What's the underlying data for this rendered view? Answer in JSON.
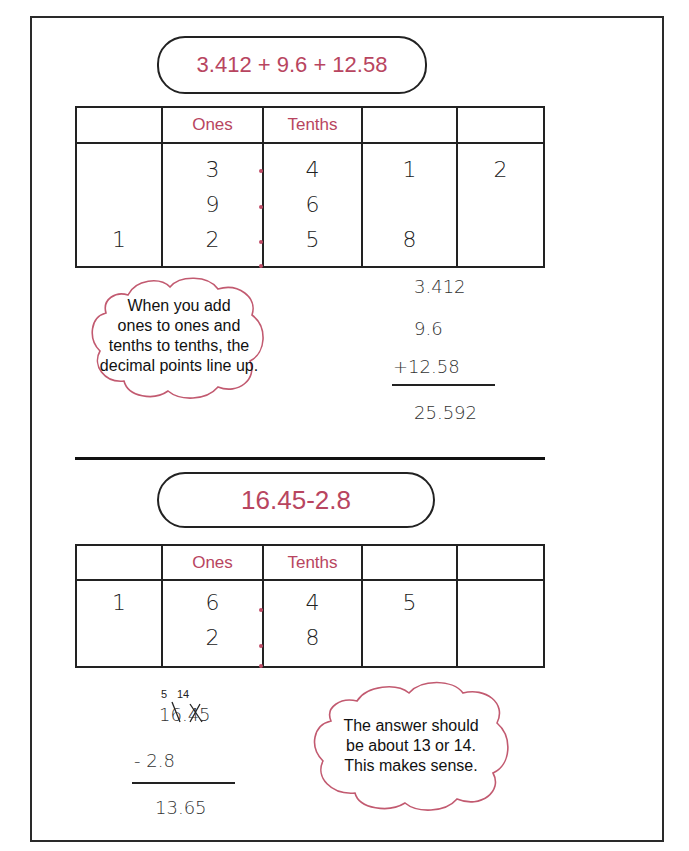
{
  "problem1": {
    "expression": "3.412 + 9.6 + 12.58",
    "table": {
      "headers": [
        "",
        "Ones",
        "Tenths",
        "",
        ""
      ],
      "columns": [
        [
          "",
          "",
          "1"
        ],
        [
          "3",
          "9",
          "2"
        ],
        [
          "4",
          "6",
          "5"
        ],
        [
          "1",
          "",
          "8"
        ],
        [
          "2",
          "",
          ""
        ]
      ]
    },
    "note": [
      "When you add",
      "ones to ones and",
      "tenths to tenths, the",
      "decimal points line up."
    ],
    "work": {
      "lines": [
        "3.412",
        "9.6",
        "+12.58"
      ],
      "answer": "25.592"
    }
  },
  "problem2": {
    "expression": "16.45-2.8",
    "table": {
      "headers": [
        "",
        "Ones",
        "Tenths",
        "",
        ""
      ],
      "columns": [
        [
          "1",
          ""
        ],
        [
          "6",
          "2"
        ],
        [
          "4",
          "8"
        ],
        [
          "5",
          ""
        ],
        [
          "",
          ""
        ]
      ]
    },
    "work": {
      "regroup": [
        "5",
        "14"
      ],
      "top": "16.45",
      "minus": "- 2.8",
      "answer": "13.65"
    },
    "note": [
      "The answer should",
      "be about 13  or 14.",
      "This makes sense."
    ]
  },
  "colors": {
    "accent": "#b84560",
    "ink": "#222222"
  }
}
